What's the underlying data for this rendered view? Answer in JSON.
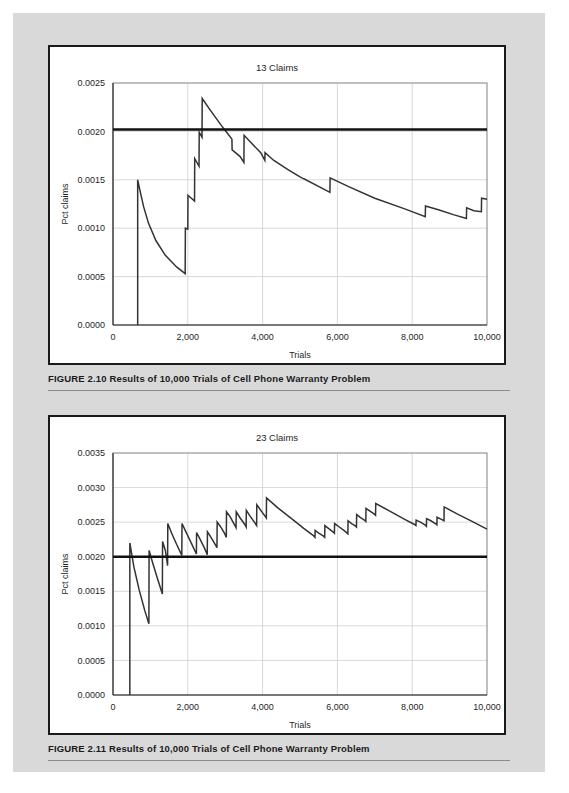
{
  "page": {
    "background_color": "#d9d9d9",
    "paper_color": "#ffffff"
  },
  "figures": [
    {
      "id": "figure-2-10",
      "caption": "FIGURE 2.10  Results of 10,000 Trials of Cell Phone Warranty Problem",
      "chart_data": {
        "type": "line",
        "title": "13 Claims",
        "xlabel": "Trials",
        "ylabel": "Pct claims",
        "xlim": [
          0,
          10000
        ],
        "ylim": [
          0.0,
          0.0025
        ],
        "grid": true,
        "legend": "none",
        "xticks": [
          0,
          2000,
          4000,
          6000,
          8000,
          10000
        ],
        "xticklabels": [
          "0",
          "2,000",
          "4,000",
          "6,000",
          "8,000",
          "10,000"
        ],
        "yticks": [
          0.0,
          0.0005,
          0.001,
          0.0015,
          0.002,
          0.0025
        ],
        "yticklabels": [
          "0.0000",
          "0.0005",
          "0.0010",
          "0.0015",
          "0.0020",
          "0.0025"
        ],
        "reference_line": {
          "value": 0.00202,
          "label": "expected 0.0020",
          "color": "#111111"
        },
        "series": [
          {
            "name": "Running pct claims",
            "color": "#333333",
            "points": [
              [
                660,
                0.0
              ],
              [
                660,
                0.0015
              ],
              [
                720,
                0.00139
              ],
              [
                820,
                0.00122
              ],
              [
                950,
                0.00105
              ],
              [
                1150,
                0.00087
              ],
              [
                1400,
                0.00072
              ],
              [
                1700,
                0.0006
              ],
              [
                1930,
                0.00053
              ],
              [
                1935,
                0.001
              ],
              [
                2000,
                0.00099
              ],
              [
                2005,
                0.00134
              ],
              [
                2180,
                0.00128
              ],
              [
                2185,
                0.00172
              ],
              [
                2300,
                0.00164
              ],
              [
                2305,
                0.00199
              ],
              [
                2380,
                0.00194
              ],
              [
                2385,
                0.00234
              ],
              [
                2600,
                0.00222
              ],
              [
                2900,
                0.00206
              ],
              [
                3100,
                0.00196
              ],
              [
                3180,
                0.00192
              ],
              [
                3185,
                0.00181
              ],
              [
                3400,
                0.00174
              ],
              [
                3500,
                0.00168
              ],
              [
                3505,
                0.00196
              ],
              [
                3700,
                0.00188
              ],
              [
                3950,
                0.00178
              ],
              [
                4060,
                0.0017
              ],
              [
                4065,
                0.00178
              ],
              [
                4300,
                0.0017
              ],
              [
                4700,
                0.0016
              ],
              [
                5000,
                0.00153
              ],
              [
                5100,
                0.00151
              ],
              [
                5105,
                0.00151
              ],
              [
                5800,
                0.00137
              ],
              [
                5805,
                0.00152
              ],
              [
                6300,
                0.00143
              ],
              [
                7000,
                0.00131
              ],
              [
                7800,
                0.0012
              ],
              [
                8350,
                0.00112
              ],
              [
                8355,
                0.00123
              ],
              [
                8700,
                0.00119
              ],
              [
                9100,
                0.00114
              ],
              [
                9450,
                0.0011
              ],
              [
                9455,
                0.00121
              ],
              [
                9650,
                0.00118
              ],
              [
                9850,
                0.00117
              ],
              [
                9855,
                0.00131
              ],
              [
                10000,
                0.0013
              ]
            ]
          }
        ]
      }
    },
    {
      "id": "figure-2-11",
      "caption": "FIGURE 2.11  Results of 10,000 Trials of Cell Phone Warranty Problem",
      "chart_data": {
        "type": "line",
        "title": "23 Claims",
        "xlabel": "Trials",
        "ylabel": "Pct claims",
        "xlim": [
          0,
          10000
        ],
        "ylim": [
          0.0,
          0.0035
        ],
        "grid": true,
        "legend": "none",
        "xticks": [
          0,
          2000,
          4000,
          6000,
          8000,
          10000
        ],
        "xticklabels": [
          "0",
          "2,000",
          "4,000",
          "6,000",
          "8,000",
          "10,000"
        ],
        "yticks": [
          0.0,
          0.0005,
          0.001,
          0.0015,
          0.002,
          0.0025,
          0.003,
          0.0035
        ],
        "yticklabels": [
          "0.0000",
          "0.0005",
          "0.0010",
          "0.0015",
          "0.0020",
          "0.0025",
          "0.0030",
          "0.0035"
        ],
        "reference_line": {
          "value": 0.002,
          "label": "expected 0.0020",
          "color": "#111111"
        },
        "series": [
          {
            "name": "Running pct claims",
            "color": "#333333",
            "points": [
              [
                450,
                0.0
              ],
              [
                450,
                0.0022
              ],
              [
                560,
                0.00185
              ],
              [
                700,
                0.00152
              ],
              [
                850,
                0.00122
              ],
              [
                960,
                0.00103
              ],
              [
                965,
                0.00209
              ],
              [
                1050,
                0.00193
              ],
              [
                1180,
                0.0017
              ],
              [
                1320,
                0.00146
              ],
              [
                1325,
                0.00222
              ],
              [
                1400,
                0.00209
              ],
              [
                1460,
                0.00187
              ],
              [
                1465,
                0.00248
              ],
              [
                1560,
                0.00235
              ],
              [
                1700,
                0.00218
              ],
              [
                1840,
                0.00202
              ],
              [
                1845,
                0.00248
              ],
              [
                1950,
                0.00236
              ],
              [
                2100,
                0.00219
              ],
              [
                2230,
                0.00204
              ],
              [
                2235,
                0.00235
              ],
              [
                2330,
                0.00225
              ],
              [
                2450,
                0.00212
              ],
              [
                2520,
                0.00203
              ],
              [
                2525,
                0.00236
              ],
              [
                2620,
                0.00228
              ],
              [
                2720,
                0.00219
              ],
              [
                2780,
                0.00213
              ],
              [
                2785,
                0.0025
              ],
              [
                2880,
                0.00243
              ],
              [
                2990,
                0.00233
              ],
              [
                3030,
                0.00228
              ],
              [
                3035,
                0.00265
              ],
              [
                3130,
                0.00258
              ],
              [
                3250,
                0.00246
              ],
              [
                3290,
                0.00242
              ],
              [
                3295,
                0.00265
              ],
              [
                3400,
                0.00256
              ],
              [
                3520,
                0.00247
              ],
              [
                3560,
                0.00243
              ],
              [
                3565,
                0.00267
              ],
              [
                3660,
                0.00259
              ],
              [
                3780,
                0.0025
              ],
              [
                3840,
                0.00245
              ],
              [
                3845,
                0.00275
              ],
              [
                3940,
                0.00268
              ],
              [
                4060,
                0.00259
              ],
              [
                4100,
                0.00256
              ],
              [
                4105,
                0.00285
              ],
              [
                4400,
                0.00271
              ],
              [
                4800,
                0.00254
              ],
              [
                5100,
                0.00241
              ],
              [
                5350,
                0.00231
              ],
              [
                5400,
                0.00228
              ],
              [
                5405,
                0.00238
              ],
              [
                5500,
                0.00234
              ],
              [
                5620,
                0.0023
              ],
              [
                5660,
                0.00228
              ],
              [
                5665,
                0.00245
              ],
              [
                5760,
                0.00241
              ],
              [
                5880,
                0.00236
              ],
              [
                5920,
                0.00234
              ],
              [
                5925,
                0.00248
              ],
              [
                6050,
                0.00243
              ],
              [
                6200,
                0.00237
              ],
              [
                6280,
                0.00233
              ],
              [
                6285,
                0.00252
              ],
              [
                6380,
                0.00248
              ],
              [
                6470,
                0.00245
              ],
              [
                6510,
                0.00243
              ],
              [
                6515,
                0.00261
              ],
              [
                6610,
                0.00257
              ],
              [
                6720,
                0.00253
              ],
              [
                6760,
                0.00251
              ],
              [
                6765,
                0.0027
              ],
              [
                6870,
                0.00266
              ],
              [
                6980,
                0.00262
              ],
              [
                7020,
                0.0026
              ],
              [
                7025,
                0.00277
              ],
              [
                7400,
                0.00266
              ],
              [
                7800,
                0.00254
              ],
              [
                8050,
                0.00247
              ],
              [
                8100,
                0.00245
              ],
              [
                8105,
                0.00253
              ],
              [
                8220,
                0.0025
              ],
              [
                8340,
                0.00246
              ],
              [
                8380,
                0.00244
              ],
              [
                8385,
                0.00255
              ],
              [
                8500,
                0.00252
              ],
              [
                8620,
                0.00248
              ],
              [
                8660,
                0.00246
              ],
              [
                8665,
                0.00257
              ],
              [
                8780,
                0.00254
              ],
              [
                8850,
                0.00252
              ],
              [
                8855,
                0.00272
              ],
              [
                9200,
                0.00262
              ],
              [
                9600,
                0.00251
              ],
              [
                10000,
                0.0024
              ]
            ]
          }
        ]
      }
    }
  ]
}
